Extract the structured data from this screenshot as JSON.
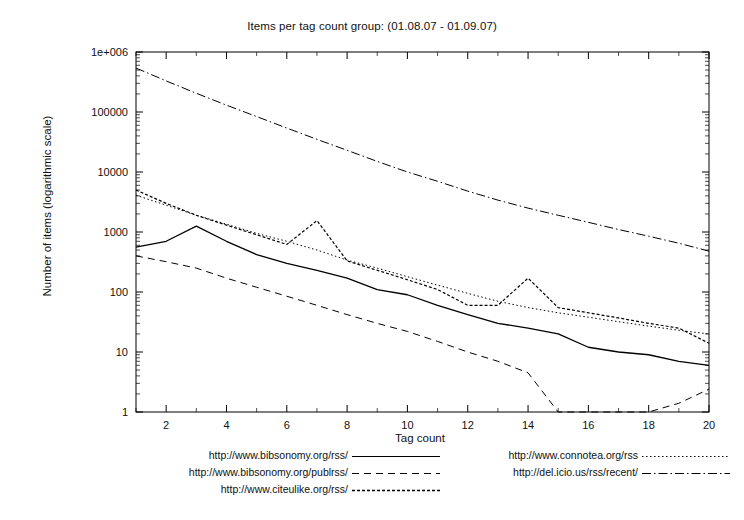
{
  "chart_data": {
    "type": "line",
    "title": "Items per tag count group: (01.08.07 - 01.09.07)",
    "xlabel": "Tag count",
    "ylabel": "Number of items (logarithmic scale)",
    "xlim": [
      1,
      20
    ],
    "ylim": [
      1,
      1000000
    ],
    "yscale": "log",
    "grid": false,
    "legend_position": "bottom",
    "xticks": [
      "2",
      "4",
      "6",
      "8",
      "10",
      "12",
      "14",
      "16",
      "18",
      "20"
    ],
    "xtick_values": [
      2,
      4,
      6,
      8,
      10,
      12,
      14,
      16,
      18,
      20
    ],
    "yticks": [
      "1",
      "10",
      "100",
      "1000",
      "10000",
      "100000",
      "1e+006"
    ],
    "ytick_values": [
      1,
      10,
      100,
      1000,
      10000,
      100000,
      1000000
    ],
    "x": [
      1,
      2,
      3,
      4,
      5,
      6,
      7,
      8,
      9,
      10,
      11,
      12,
      13,
      14,
      15,
      16,
      17,
      18,
      19,
      20
    ],
    "series": [
      {
        "name": "http://www.bibsonomy.org/rss/",
        "style": "solid",
        "values": [
          560,
          700,
          1250,
          700,
          420,
          300,
          230,
          170,
          110,
          90,
          60,
          42,
          30,
          25,
          20,
          12,
          10,
          9,
          7,
          6
        ]
      },
      {
        "name": "http://www.bibsonomy.org/publrss/",
        "style": "dashed",
        "values": [
          400,
          320,
          250,
          170,
          120,
          85,
          60,
          42,
          30,
          22,
          15,
          10,
          7,
          4.5,
          1,
          1,
          1,
          1,
          1.4,
          2.4
        ]
      },
      {
        "name": "http://www.citeulike.org/rss/",
        "style": "dotted-dense",
        "values": [
          5000,
          3000,
          1900,
          1300,
          900,
          620,
          1550,
          330,
          230,
          160,
          110,
          60,
          60,
          170,
          55,
          45,
          37,
          30,
          25,
          14
        ]
      },
      {
        "name": "http://www.connotea.org/rss",
        "style": "dotted",
        "values": [
          4100,
          2800,
          1900,
          1350,
          950,
          700,
          500,
          340,
          250,
          180,
          130,
          95,
          70,
          55,
          45,
          38,
          32,
          27,
          23,
          20
        ]
      },
      {
        "name": "http://del.icio.us/rss/recent/",
        "style": "dash-dot",
        "values": [
          540000,
          330000,
          205000,
          130000,
          84000,
          54000,
          35000,
          23000,
          15000,
          10000,
          7000,
          4800,
          3400,
          2500,
          1900,
          1450,
          1100,
          850,
          650,
          480
        ]
      }
    ]
  }
}
